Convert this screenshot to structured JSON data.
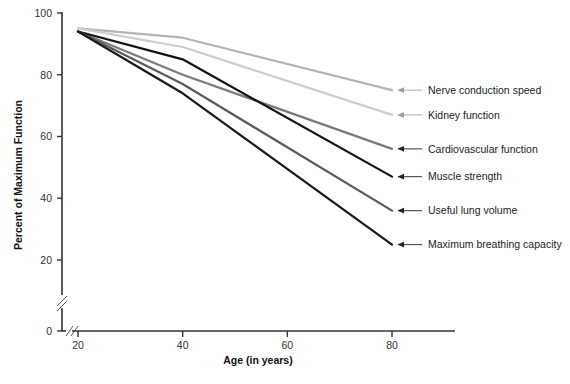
{
  "chart_data": {
    "type": "line",
    "title": "",
    "xlabel": "Age (in years)",
    "ylabel": "Percent of Maximum Function",
    "x": [
      20,
      40,
      80
    ],
    "xlim": [
      18,
      82
    ],
    "ylim": [
      0,
      100
    ],
    "xticks": [
      "20",
      "40",
      "60",
      "80"
    ],
    "yticks": [
      "0",
      "20",
      "40",
      "60",
      "80",
      "100"
    ],
    "grid": false,
    "legend_position": "right-inline-labels",
    "axis_break_x": true,
    "axis_break_y": true,
    "series": [
      {
        "name": "Nerve conduction speed",
        "color": "#b4b4b4",
        "values": [
          95,
          92,
          75
        ],
        "label": "Nerve conduction speed"
      },
      {
        "name": "Kidney function",
        "color": "#cdcdcd",
        "values": [
          95,
          89,
          67
        ],
        "label": "Kidney function"
      },
      {
        "name": "Cardiovascular function",
        "color": "#7a7a7a",
        "values": [
          94,
          80,
          56
        ],
        "label": "Cardiovascular function"
      },
      {
        "name": "Muscle strength",
        "color": "#111111",
        "values": [
          94,
          85,
          47
        ],
        "label": "Muscle strength"
      },
      {
        "name": "Useful lung volume",
        "color": "#5a5a5a",
        "values": [
          94,
          77,
          36
        ],
        "label": "Useful lung volume"
      },
      {
        "name": "Maximum breathing capacity",
        "color": "#1a1a1a",
        "values": [
          94,
          74,
          25
        ],
        "label": "Maximum breathing capacity"
      }
    ]
  },
  "axis": {
    "x_title": "Age (in years)",
    "y_title": "Percent of Maximum Function",
    "x_ticks": [
      "20",
      "40",
      "60",
      "80"
    ],
    "y_ticks": [
      "100",
      "80",
      "60",
      "40",
      "20",
      "0"
    ]
  },
  "colors": {
    "axis": "#333333",
    "text": "#222222",
    "background": "#ffffff"
  }
}
